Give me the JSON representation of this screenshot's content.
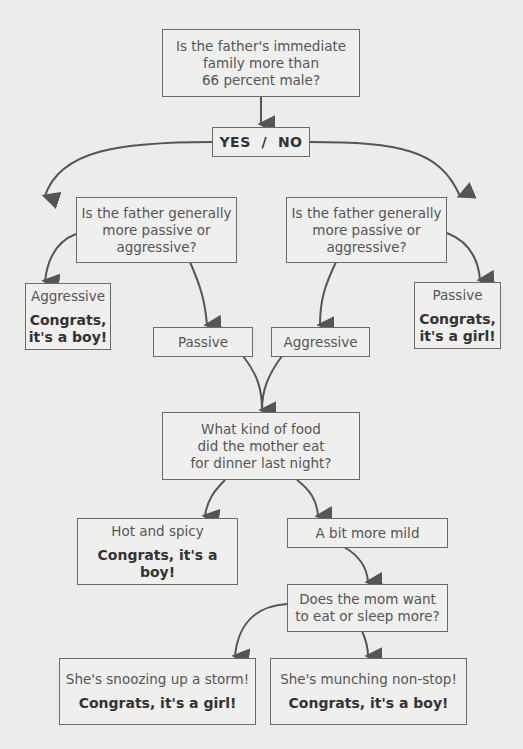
{
  "diagram": {
    "type": "flowchart",
    "nodes": {
      "q1": {
        "lines": [
          "Is the father's immediate",
          "family more than",
          "66 percent male?"
        ]
      },
      "yesno": {
        "label": "YES  /  NO"
      },
      "q_left": {
        "lines": [
          "Is the father generally",
          "more passive or",
          "aggressive?"
        ]
      },
      "q_right": {
        "lines": [
          "Is the father generally",
          "more passive or",
          "aggressive?"
        ]
      },
      "left_aggressive": {
        "label": "Aggressive",
        "result_lines": [
          "Congrats,",
          "it's a boy!"
        ]
      },
      "right_passive": {
        "label": "Passive",
        "result_lines": [
          "Congrats,",
          "it's a girl!"
        ]
      },
      "mid_passive": {
        "label": "Passive"
      },
      "mid_aggressive": {
        "label": "Aggressive"
      },
      "q_food": {
        "lines": [
          "What kind of food",
          "did the mother eat",
          "for dinner last night?"
        ]
      },
      "hot": {
        "label": "Hot and spicy",
        "result": "Congrats, it's a boy!"
      },
      "mild": {
        "label": "A bit more mild"
      },
      "q_mom": {
        "lines": [
          "Does the mom want",
          "to eat or sleep more?"
        ]
      },
      "snoozing": {
        "label": "She's snoozing up a storm!",
        "result": "Congrats, it's a girl!"
      },
      "munching": {
        "label": "She's munching non-stop!",
        "result": "Congrats, it's a boy!"
      }
    },
    "colors": {
      "background": "#ececea",
      "border": "#6a6a6a",
      "arrow": "#555555",
      "text": "#555555",
      "bold_text": "#333333"
    }
  }
}
